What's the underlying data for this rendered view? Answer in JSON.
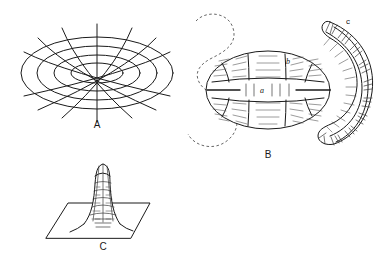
{
  "figure": {
    "background_color": "#ffffff",
    "line_color": "#1a1a1a",
    "width": 388,
    "height": 264
  },
  "panels": [
    {
      "id": "A",
      "label": "A",
      "name": "panel-a-elliptical-grid",
      "description": "Concentric ellipses crossed by radiating meridian curves forming a toroidal coordinate grid",
      "label_x": 97,
      "label_y": 128,
      "rings": 4,
      "meridians": 7
    },
    {
      "id": "B",
      "label": "B",
      "name": "panel-b-segmented-torus",
      "description": "Segmented ovoid body with equatorial band beside a hatched crescent and a sinuous dashed outline",
      "label_x": 268,
      "label_y": 158,
      "sublabels": [
        {
          "text": "a",
          "name": "sublabel-a",
          "x": 262,
          "y": 93
        },
        {
          "text": "b",
          "name": "sublabel-b",
          "x": 288,
          "y": 64
        },
        {
          "text": "c",
          "name": "sublabel-c",
          "x": 348,
          "y": 24
        }
      ]
    },
    {
      "id": "C",
      "label": "C",
      "name": "panel-c-funnel-on-plane",
      "description": "Ribbed funnel or tower rising from a parallelogram ground plane",
      "label_x": 103,
      "label_y": 250
    }
  ],
  "labels": {
    "panel_a": "A",
    "panel_b": "B",
    "panel_c": "C",
    "sub_a": "a",
    "sub_b": "b",
    "sub_c": "c"
  }
}
